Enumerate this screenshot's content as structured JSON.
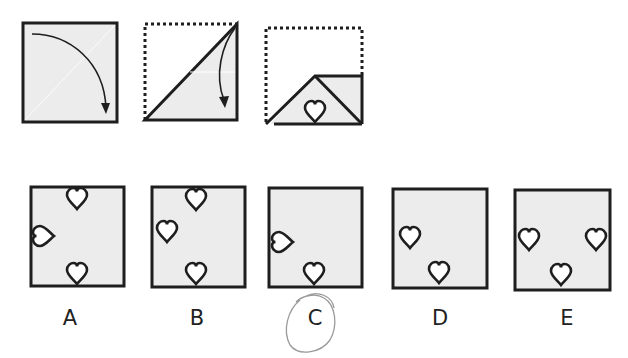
{
  "colors": {
    "ink": "#1e1e1e",
    "fill": "#ececec",
    "heart_fill": "#ffffff",
    "annotation": "#9a9a9a",
    "background": "#ffffff"
  },
  "fold_sequence": {
    "steps": [
      {
        "id": "step-1",
        "description": "Square folded diagonally: top-left corner brought down to bottom-right",
        "square": [
          22,
          22,
          118,
          123
        ],
        "arrow": "curved arrow from top-left toward bottom-right corner"
      },
      {
        "id": "step-2",
        "description": "Triangle folded again: top-right corner brought down",
        "dotted_outline": [
          145,
          24,
          237,
          120
        ],
        "arrow": "curved arrow from top-right corner pointing downward"
      },
      {
        "id": "step-3",
        "description": "Folded shape with heart cut out along bottom fold edge",
        "dotted_outline": [
          266,
          28,
          362,
          124
        ],
        "cut_shape": "heart",
        "heart_center": [
          315,
          108
        ]
      }
    ]
  },
  "options": [
    {
      "label": "A",
      "square": [
        31,
        187,
        124,
        286
      ],
      "hearts": [
        {
          "cx": 77,
          "cy": 199,
          "rot": 0
        },
        {
          "cx": 44,
          "cy": 236,
          "rot": 90
        },
        {
          "cx": 77,
          "cy": 274,
          "rot": 0
        }
      ],
      "label_pos": [
        70,
        318
      ],
      "selected": false
    },
    {
      "label": "B",
      "square": [
        152,
        187,
        245,
        287
      ],
      "hearts": [
        {
          "cx": 196,
          "cy": 200,
          "rot": 0
        },
        {
          "cx": 167,
          "cy": 232,
          "rot": 0
        },
        {
          "cx": 196,
          "cy": 274,
          "rot": 0
        }
      ],
      "label_pos": [
        197,
        318
      ],
      "selected": false
    },
    {
      "label": "C",
      "square": [
        269,
        188,
        362,
        287
      ],
      "hearts": [
        {
          "cx": 283,
          "cy": 242,
          "rot": 90
        },
        {
          "cx": 314,
          "cy": 274,
          "rot": 0
        }
      ],
      "label_pos": [
        315,
        318
      ],
      "selected": true
    },
    {
      "label": "D",
      "square": [
        393,
        189,
        487,
        288
      ],
      "hearts": [
        {
          "cx": 410,
          "cy": 238,
          "rot": 0
        },
        {
          "cx": 439,
          "cy": 273,
          "rot": 0
        }
      ],
      "label_pos": [
        440,
        318
      ],
      "selected": false
    },
    {
      "label": "E",
      "square": [
        515,
        190,
        610,
        290
      ],
      "hearts": [
        {
          "cx": 529,
          "cy": 240,
          "rot": 0
        },
        {
          "cx": 596,
          "cy": 240,
          "rot": 0
        },
        {
          "cx": 561,
          "cy": 275,
          "rot": 0
        }
      ],
      "label_pos": [
        567,
        318
      ],
      "selected": false
    }
  ]
}
